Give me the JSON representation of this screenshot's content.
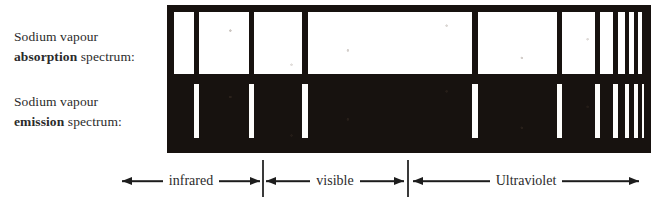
{
  "figure": {
    "colors": {
      "ink": "#17120f",
      "paper": "#ffffff",
      "line_light": "#fdfdfb",
      "text": "#2b2b2b"
    }
  },
  "labels": {
    "absorption": {
      "line1": "Sodium vapour",
      "strong": "absorption",
      "line2_rest": " spectrum:"
    },
    "emission": {
      "line1": "Sodium vapour",
      "strong": "emission",
      "line2_rest": " spectrum:"
    }
  },
  "regions": [
    {
      "name": "infrared-region",
      "label": "infrared",
      "left": 122,
      "width": 138
    },
    {
      "name": "visible-region",
      "label": "visible",
      "left": 266,
      "width": 138
    },
    {
      "name": "ultraviolet-region",
      "label": "Ultraviolet",
      "left": 413,
      "width": 226
    }
  ],
  "dividers": [
    {
      "name": "infrared-visible-divider",
      "x": 262
    },
    {
      "name": "visible-ultraviolet-divider",
      "x": 407
    }
  ],
  "spectrum_lines": [
    {
      "name": "line-1",
      "x": 27,
      "width": 5
    },
    {
      "name": "line-2",
      "x": 82,
      "width": 5
    },
    {
      "name": "line-3",
      "x": 135,
      "width": 6
    },
    {
      "name": "line-4",
      "x": 305,
      "width": 6
    },
    {
      "name": "line-5",
      "x": 390,
      "width": 5
    },
    {
      "name": "line-6",
      "x": 428,
      "width": 5
    },
    {
      "name": "line-7",
      "x": 446,
      "width": 5
    },
    {
      "name": "line-8",
      "x": 458,
      "width": 4
    },
    {
      "name": "line-9",
      "x": 467,
      "width": 4
    },
    {
      "name": "line-10",
      "x": 475,
      "width": 3
    }
  ]
}
